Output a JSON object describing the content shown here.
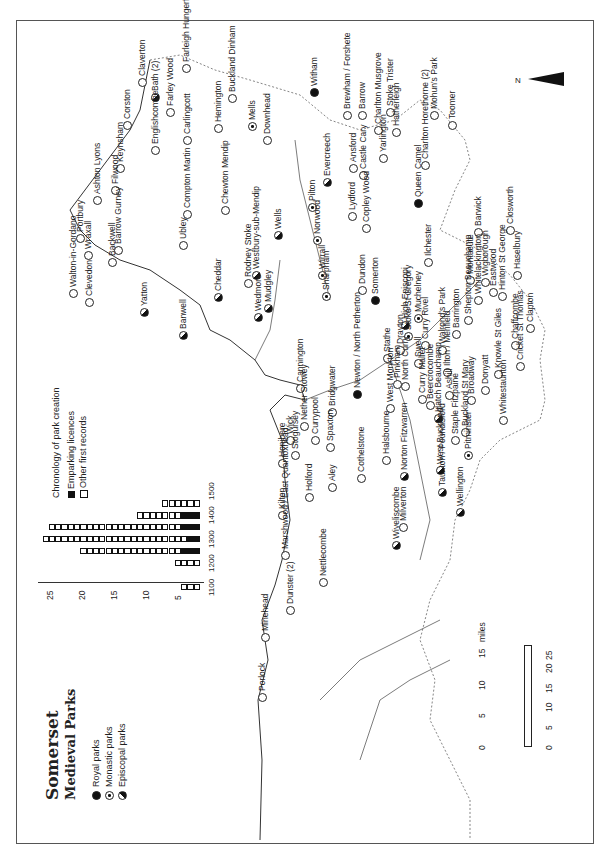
{
  "title": "Somerset",
  "subtitle": "Medieval Parks",
  "legend": {
    "royal": "Royal parks",
    "monastic": "Monastic parks",
    "episcopal": "Episcopal parks"
  },
  "chronology_legend": {
    "title": "Chronology of park creation",
    "emparking": "Emparking licences",
    "other": "Other first records"
  },
  "scale": {
    "miles_label": "miles",
    "km_label": "km",
    "miles_ticks": [
      "0",
      "5",
      "10",
      "15"
    ],
    "km_ticks": [
      "0",
      "5",
      "10",
      "15",
      "20",
      "25"
    ]
  },
  "north_label": "N",
  "chart_data": {
    "type": "bar",
    "title": "Chronology of park creation",
    "orientation": "horizontal (printed rotated)",
    "categories": [
      "1100-1150",
      "1150-1200",
      "1200-1250",
      "1250-1300",
      "1300-1350",
      "1350-1400",
      "1400-1450",
      "1450-1500"
    ],
    "series": [
      {
        "name": "Emparking licences",
        "values": [
          0,
          0,
          0,
          3,
          2,
          3,
          3,
          0
        ]
      },
      {
        "name": "Other first records",
        "values": [
          3,
          0,
          4,
          16,
          23,
          21,
          7,
          6
        ]
      }
    ],
    "totals": [
      3,
      0,
      4,
      19,
      25,
      24,
      10,
      6
    ],
    "tick_labels_century": [
      "1100",
      "1200",
      "1300",
      "1400",
      "1500"
    ],
    "value_ticks": [
      "5",
      "10",
      "15",
      "20",
      "25"
    ],
    "ylim": [
      0,
      25
    ]
  },
  "sites": [
    {
      "name": "Claverton",
      "type": "other",
      "x": 142,
      "y": 82
    },
    {
      "name": "Bath (2)",
      "type": "episcopal",
      "x": 155,
      "y": 97
    },
    {
      "name": "Farley Wood",
      "type": "other",
      "x": 170,
      "y": 112
    },
    {
      "name": "Farleigh Hungerford",
      "type": "other",
      "x": 186,
      "y": 68
    },
    {
      "name": "Corston",
      "type": "other",
      "x": 127,
      "y": 125
    },
    {
      "name": "Keynsham",
      "type": "other",
      "x": 120,
      "y": 168
    },
    {
      "name": "Englishcombe",
      "type": "other",
      "x": 155,
      "y": 150
    },
    {
      "name": "Carlingcott",
      "type": "other",
      "x": 187,
      "y": 140
    },
    {
      "name": "Hemington",
      "type": "other",
      "x": 218,
      "y": 128
    },
    {
      "name": "Buckland Dinham",
      "type": "other",
      "x": 232,
      "y": 98
    },
    {
      "name": "Mells",
      "type": "monastic",
      "x": 252,
      "y": 126
    },
    {
      "name": "Downhead",
      "type": "other",
      "x": 267,
      "y": 140
    },
    {
      "name": "Witham",
      "type": "royal",
      "x": 314,
      "y": 92
    },
    {
      "name": "Brewham / Forshete",
      "type": "other",
      "x": 347,
      "y": 115
    },
    {
      "name": "Barrow",
      "type": "other",
      "x": 362,
      "y": 115
    },
    {
      "name": "Charlton Musgrove",
      "type": "other",
      "x": 378,
      "y": 130
    },
    {
      "name": "Stoke Trister",
      "type": "other",
      "x": 390,
      "y": 112
    },
    {
      "name": "Hatherleigh",
      "type": "other",
      "x": 396,
      "y": 132
    },
    {
      "name": "Evercreech",
      "type": "episcopal",
      "x": 327,
      "y": 182
    },
    {
      "name": "Castle Cary",
      "type": "other",
      "x": 363,
      "y": 175
    },
    {
      "name": "Ansford",
      "type": "other",
      "x": 353,
      "y": 168
    },
    {
      "name": "Yarlington",
      "type": "other",
      "x": 383,
      "y": 158
    },
    {
      "name": "Pilton",
      "type": "monastic",
      "x": 312,
      "y": 207
    },
    {
      "name": "Norwood",
      "type": "monastic",
      "x": 317,
      "y": 240
    },
    {
      "name": "Wirrall",
      "type": "monastic",
      "x": 322,
      "y": 275
    },
    {
      "name": "Sharpham",
      "type": "monastic",
      "x": 326,
      "y": 296
    },
    {
      "name": "Lydford",
      "type": "other",
      "x": 352,
      "y": 216
    },
    {
      "name": "Copley Wood",
      "type": "other",
      "x": 366,
      "y": 228
    },
    {
      "name": "Queen Camel",
      "type": "royal",
      "x": 418,
      "y": 203
    },
    {
      "name": "Charlton Horethorne (2)",
      "type": "other",
      "x": 425,
      "y": 165
    },
    {
      "name": "Mohun's Park",
      "type": "other",
      "x": 434,
      "y": 115
    },
    {
      "name": "Toomer",
      "type": "other",
      "x": 452,
      "y": 125
    },
    {
      "name": "Ilchester",
      "type": "other",
      "x": 428,
      "y": 262
    },
    {
      "name": "Barwick",
      "type": "other",
      "x": 478,
      "y": 232
    },
    {
      "name": "Closworth",
      "type": "other",
      "x": 510,
      "y": 230
    },
    {
      "name": "Montacute",
      "type": "other",
      "x": 470,
      "y": 280
    },
    {
      "name": "Haselbury",
      "type": "other",
      "x": 517,
      "y": 275
    },
    {
      "name": "Clapton",
      "type": "other",
      "x": 530,
      "y": 328
    },
    {
      "name": "Portbury",
      "type": "other",
      "x": 80,
      "y": 238
    },
    {
      "name": "Wraxall",
      "type": "other",
      "x": 88,
      "y": 255
    },
    {
      "name": "Ashton Lyons",
      "type": "other",
      "x": 97,
      "y": 200
    },
    {
      "name": "Filwood",
      "type": "other",
      "x": 115,
      "y": 190
    },
    {
      "name": "Backwell",
      "type": "other",
      "x": 112,
      "y": 262
    },
    {
      "name": "Barrow Gurney",
      "type": "other",
      "x": 118,
      "y": 250
    },
    {
      "name": "Walton-in-Gordano",
      "type": "other",
      "x": 73,
      "y": 293
    },
    {
      "name": "Clevedon",
      "type": "other",
      "x": 89,
      "y": 302
    },
    {
      "name": "Compton Martin",
      "type": "other",
      "x": 187,
      "y": 214
    },
    {
      "name": "Ubley",
      "type": "other",
      "x": 183,
      "y": 245
    },
    {
      "name": "Chewton Mendip",
      "type": "other",
      "x": 225,
      "y": 210
    },
    {
      "name": "Yatton",
      "type": "episcopal",
      "x": 144,
      "y": 312
    },
    {
      "name": "Banwell",
      "type": "episcopal",
      "x": 183,
      "y": 335
    },
    {
      "name": "Cheddar",
      "type": "episcopal",
      "x": 218,
      "y": 297
    },
    {
      "name": "Wells",
      "type": "episcopal",
      "x": 278,
      "y": 235
    },
    {
      "name": "Westbury-sub-Mendip",
      "type": "episcopal",
      "x": 256,
      "y": 275
    },
    {
      "name": "Rodney Stoke",
      "type": "other",
      "x": 248,
      "y": 283
    },
    {
      "name": "Wedmore",
      "type": "episcopal",
      "x": 258,
      "y": 317
    },
    {
      "name": "Mudgley",
      "type": "episcopal",
      "x": 268,
      "y": 308
    },
    {
      "name": "Dundon",
      "type": "other",
      "x": 362,
      "y": 290
    },
    {
      "name": "Somerton",
      "type": "royal",
      "x": 375,
      "y": 300
    },
    {
      "name": "High Episcopi",
      "type": "episcopal",
      "x": 405,
      "y": 325
    },
    {
      "name": "Muchelney",
      "type": "monastic",
      "x": 418,
      "y": 318
    },
    {
      "name": "Stoke St Gregory",
      "type": "monastic",
      "x": 408,
      "y": 336
    },
    {
      "name": "Drayton",
      "type": "other",
      "x": 400,
      "y": 350
    },
    {
      "name": "Curry Rivel",
      "type": "other",
      "x": 425,
      "y": 345
    },
    {
      "name": "Swell",
      "type": "other",
      "x": 418,
      "y": 363
    },
    {
      "name": "Stathe",
      "type": "other",
      "x": 387,
      "y": 358
    },
    {
      "name": "Walrond's Park",
      "type": "other",
      "x": 442,
      "y": 350
    },
    {
      "name": "Barrington",
      "type": "other",
      "x": 456,
      "y": 334
    },
    {
      "name": "Shepton Beauchamp",
      "type": "other",
      "x": 468,
      "y": 320
    },
    {
      "name": "Whitelackington",
      "type": "other",
      "x": 478,
      "y": 300
    },
    {
      "name": "Wigborough",
      "type": "other",
      "x": 485,
      "y": 282
    },
    {
      "name": "Eastwood",
      "type": "other",
      "x": 493,
      "y": 292
    },
    {
      "name": "Hinton St George",
      "type": "other",
      "x": 502,
      "y": 296
    },
    {
      "name": "Chaffcombe",
      "type": "other",
      "x": 515,
      "y": 345
    },
    {
      "name": "Cricket St Thomas",
      "type": "other",
      "x": 520,
      "y": 366
    },
    {
      "name": "Knowle St Giles",
      "type": "other",
      "x": 498,
      "y": 374
    },
    {
      "name": "Donyatt",
      "type": "other",
      "x": 485,
      "y": 390
    },
    {
      "name": "Broadway",
      "type": "other",
      "x": 471,
      "y": 400
    },
    {
      "name": "Ilton / Merifield",
      "type": "other",
      "x": 447,
      "y": 372
    },
    {
      "name": "Ashill",
      "type": "other",
      "x": 449,
      "y": 395
    },
    {
      "name": "Newton / North Petherton",
      "type": "royal",
      "x": 357,
      "y": 394
    },
    {
      "name": "West Monkton",
      "type": "other",
      "x": 390,
      "y": 408
    },
    {
      "name": "Pinkham",
      "type": "other",
      "x": 397,
      "y": 384
    },
    {
      "name": "North Curry",
      "type": "other",
      "x": 405,
      "y": 386
    },
    {
      "name": "Curry Mallet",
      "type": "other",
      "x": 422,
      "y": 399
    },
    {
      "name": "Beercrocombe",
      "type": "other",
      "x": 430,
      "y": 405
    },
    {
      "name": "Hatch Beauchamp",
      "type": "episcopal",
      "x": 438,
      "y": 418
    },
    {
      "name": "Staple Fitzpaine",
      "type": "other",
      "x": 455,
      "y": 440
    },
    {
      "name": "Buckland St Mary",
      "type": "other",
      "x": 465,
      "y": 432
    },
    {
      "name": "Whitestaunton",
      "type": "other",
      "x": 503,
      "y": 420
    },
    {
      "name": "Pitminster",
      "type": "monastic",
      "x": 468,
      "y": 455
    },
    {
      "name": "Taunton / Poundisford",
      "type": "episcopal",
      "x": 442,
      "y": 492
    },
    {
      "name": "West Buckland",
      "type": "episcopal",
      "x": 440,
      "y": 470
    },
    {
      "name": "Wellington",
      "type": "episcopal",
      "x": 460,
      "y": 512
    },
    {
      "name": "Bridgwater",
      "type": "other",
      "x": 332,
      "y": 412
    },
    {
      "name": "Cannington",
      "type": "other",
      "x": 300,
      "y": 388
    },
    {
      "name": "Nether Stowey",
      "type": "other",
      "x": 304,
      "y": 426
    },
    {
      "name": "Currypool",
      "type": "other",
      "x": 315,
      "y": 440
    },
    {
      "name": "Spaxton",
      "type": "other",
      "x": 330,
      "y": 447
    },
    {
      "name": "Wick",
      "type": "other",
      "x": 290,
      "y": 440
    },
    {
      "name": "Honibere",
      "type": "other",
      "x": 282,
      "y": 463
    },
    {
      "name": "Stogursey",
      "type": "other",
      "x": 295,
      "y": 455
    },
    {
      "name": "Aley",
      "type": "other",
      "x": 332,
      "y": 487
    },
    {
      "name": "Holford",
      "type": "other",
      "x": 309,
      "y": 497
    },
    {
      "name": "Kilton",
      "type": "other",
      "x": 282,
      "y": 515
    },
    {
      "name": "Cothelstone",
      "type": "other",
      "x": 361,
      "y": 478
    },
    {
      "name": "Halsbourne",
      "type": "other",
      "x": 386,
      "y": 460
    },
    {
      "name": "Norton Fitzwarren",
      "type": "episcopal",
      "x": 404,
      "y": 476
    },
    {
      "name": "Milverton",
      "type": "other",
      "x": 403,
      "y": 527
    },
    {
      "name": "Wiveliscombe",
      "type": "episcopal",
      "x": 396,
      "y": 545
    },
    {
      "name": "Marshwood / East Quantoxhead",
      "type": "other",
      "x": 285,
      "y": 555
    },
    {
      "name": "Nettlecombe",
      "type": "other",
      "x": 323,
      "y": 582
    },
    {
      "name": "Dunster (2)",
      "type": "other",
      "x": 290,
      "y": 610
    },
    {
      "name": "Minehead",
      "type": "other",
      "x": 265,
      "y": 637
    },
    {
      "name": "Porlock",
      "type": "other",
      "x": 262,
      "y": 697
    }
  ]
}
